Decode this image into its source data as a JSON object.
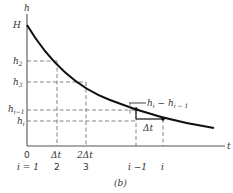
{
  "figure": {
    "caption": "(b)",
    "axes": {
      "y_label": "h",
      "x_label": "t",
      "y_ticks": [
        {
          "label": "H",
          "sub": ""
        },
        {
          "label": "h",
          "sub": "2"
        },
        {
          "label": "h",
          "sub": "3"
        },
        {
          "label": "h",
          "sub": "i−1"
        },
        {
          "label": "h",
          "sub": "i"
        }
      ],
      "x_ticks_time": [
        "0",
        "Δt",
        "2Δt"
      ],
      "x_ticks_index": [
        "i = 1",
        "2",
        "3",
        "i −1",
        "i"
      ]
    },
    "annotations": {
      "difference_label": "h",
      "difference_sub1": "i",
      "difference_minus": " − h",
      "difference_sub2": "i − 1",
      "step_label": "Δt"
    },
    "colors": {
      "curve": "#111111",
      "axis": "#555555",
      "dashes": "#666666"
    }
  }
}
